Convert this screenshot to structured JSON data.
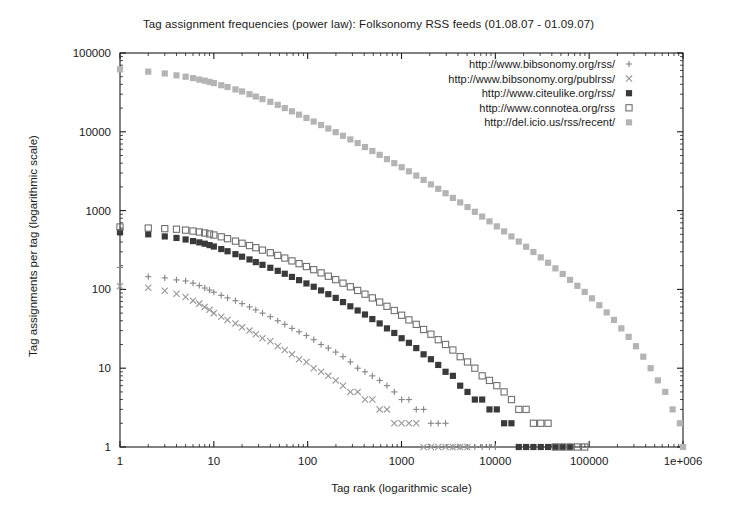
{
  "chart_data": {
    "type": "scatter",
    "title": "Tag assignment frequencies (power law): Folksonomy RSS feeds (01.08.07 - 01.09.07)",
    "xlabel": "Tag rank (logarithmic scale)",
    "ylabel": "Tag assignments per tag (logarithmic scale)",
    "xscale": "log",
    "yscale": "log",
    "xlim": [
      1,
      1000000
    ],
    "ylim": [
      1,
      100000
    ],
    "grid": false,
    "legend_position": "top-right",
    "xticks": [
      {
        "value": 1,
        "label": "1"
      },
      {
        "value": 10,
        "label": "10"
      },
      {
        "value": 100,
        "label": "100"
      },
      {
        "value": 1000,
        "label": "1000"
      },
      {
        "value": 10000,
        "label": "10000"
      },
      {
        "value": 100000,
        "label": "100000"
      },
      {
        "value": 1000000,
        "label": "1e+006"
      }
    ],
    "yticks": [
      {
        "value": 1,
        "label": "1"
      },
      {
        "value": 10,
        "label": "10"
      },
      {
        "value": 100,
        "label": "100"
      },
      {
        "value": 1000,
        "label": "1000"
      },
      {
        "value": 10000,
        "label": "10000"
      },
      {
        "value": 100000,
        "label": "100000"
      }
    ],
    "series": [
      {
        "name": "http://www.bibsonomy.org/rss/",
        "marker": "plus",
        "color": "#888888",
        "points": [
          [
            1,
            190
          ],
          [
            2,
            145
          ],
          [
            3,
            140
          ],
          [
            4,
            132
          ],
          [
            5,
            128
          ],
          [
            6,
            120
          ],
          [
            7,
            112
          ],
          [
            8,
            104
          ],
          [
            9,
            98
          ],
          [
            10,
            92
          ],
          [
            12,
            84
          ],
          [
            14,
            78
          ],
          [
            17,
            72
          ],
          [
            20,
            66
          ],
          [
            24,
            60
          ],
          [
            28,
            55
          ],
          [
            33,
            50
          ],
          [
            40,
            45
          ],
          [
            48,
            40
          ],
          [
            57,
            36
          ],
          [
            68,
            32
          ],
          [
            81,
            29
          ],
          [
            97,
            26
          ],
          [
            116,
            23
          ],
          [
            139,
            20
          ],
          [
            166,
            18
          ],
          [
            199,
            16
          ],
          [
            238,
            14
          ],
          [
            285,
            12
          ],
          [
            341,
            10
          ],
          [
            408,
            9
          ],
          [
            489,
            8
          ],
          [
            585,
            7
          ],
          [
            700,
            6
          ],
          [
            838,
            5
          ],
          [
            1003,
            4
          ],
          [
            1200,
            4
          ],
          [
            1437,
            3
          ],
          [
            1720,
            3
          ],
          [
            2058,
            2
          ],
          [
            2463,
            2
          ],
          [
            2948,
            2
          ],
          [
            3528,
            1
          ],
          [
            4222,
            1
          ],
          [
            5053,
            1
          ],
          [
            6048,
            1
          ],
          [
            7238,
            1
          ],
          [
            8663,
            1
          ],
          [
            10000,
            1
          ]
        ]
      },
      {
        "name": "http://www.bibsonomy.org/publrss/",
        "marker": "cross",
        "color": "#9a9a9a",
        "points": [
          [
            1,
            110
          ],
          [
            2,
            105
          ],
          [
            3,
            96
          ],
          [
            4,
            88
          ],
          [
            5,
            80
          ],
          [
            6,
            72
          ],
          [
            7,
            66
          ],
          [
            8,
            60
          ],
          [
            9,
            55
          ],
          [
            10,
            50
          ],
          [
            12,
            45
          ],
          [
            14,
            41
          ],
          [
            17,
            37
          ],
          [
            20,
            33
          ],
          [
            24,
            30
          ],
          [
            28,
            27
          ],
          [
            33,
            24
          ],
          [
            40,
            22
          ],
          [
            48,
            19
          ],
          [
            57,
            17
          ],
          [
            68,
            15
          ],
          [
            81,
            13
          ],
          [
            97,
            12
          ],
          [
            116,
            10
          ],
          [
            139,
            9
          ],
          [
            166,
            8
          ],
          [
            199,
            7
          ],
          [
            238,
            6
          ],
          [
            285,
            5
          ],
          [
            341,
            5
          ],
          [
            408,
            4
          ],
          [
            489,
            4
          ],
          [
            585,
            3
          ],
          [
            700,
            3
          ],
          [
            838,
            2
          ],
          [
            1003,
            2
          ],
          [
            1200,
            2
          ],
          [
            1437,
            2
          ],
          [
            1720,
            1
          ],
          [
            2058,
            1
          ],
          [
            2463,
            1
          ],
          [
            2948,
            1
          ],
          [
            3528,
            1
          ],
          [
            4222,
            1
          ],
          [
            5053,
            1
          ]
        ]
      },
      {
        "name": "http://www.citeulike.org/rss/",
        "marker": "filled-square",
        "color": "#3a3a3a",
        "points": [
          [
            1,
            530
          ],
          [
            2,
            500
          ],
          [
            3,
            470
          ],
          [
            4,
            450
          ],
          [
            5,
            430
          ],
          [
            6,
            410
          ],
          [
            7,
            395
          ],
          [
            8,
            380
          ],
          [
            9,
            365
          ],
          [
            10,
            350
          ],
          [
            12,
            325
          ],
          [
            14,
            305
          ],
          [
            17,
            280
          ],
          [
            20,
            260
          ],
          [
            24,
            240
          ],
          [
            28,
            222
          ],
          [
            33,
            205
          ],
          [
            40,
            188
          ],
          [
            48,
            172
          ],
          [
            57,
            158
          ],
          [
            68,
            144
          ],
          [
            81,
            131
          ],
          [
            97,
            119
          ],
          [
            116,
            108
          ],
          [
            139,
            97
          ],
          [
            166,
            87
          ],
          [
            199,
            78
          ],
          [
            238,
            69
          ],
          [
            285,
            61
          ],
          [
            341,
            54
          ],
          [
            408,
            48
          ],
          [
            489,
            42
          ],
          [
            585,
            37
          ],
          [
            700,
            32
          ],
          [
            838,
            28
          ],
          [
            1003,
            24
          ],
          [
            1200,
            21
          ],
          [
            1437,
            18
          ],
          [
            1720,
            15
          ],
          [
            2058,
            13
          ],
          [
            2463,
            11
          ],
          [
            2948,
            9
          ],
          [
            3528,
            8
          ],
          [
            4222,
            6
          ],
          [
            5053,
            5
          ],
          [
            6048,
            4
          ],
          [
            7238,
            4
          ],
          [
            8663,
            3
          ],
          [
            10368,
            3
          ],
          [
            12409,
            2
          ],
          [
            14853,
            2
          ],
          [
            17779,
            1
          ],
          [
            21281,
            1
          ],
          [
            25472,
            1
          ],
          [
            30490,
            1
          ],
          [
            36490,
            1
          ],
          [
            43673,
            1
          ],
          [
            52270,
            1
          ],
          [
            62560,
            1
          ]
        ]
      },
      {
        "name": "http://www.connotea.org/rss",
        "marker": "open-square",
        "color": "#707070",
        "points": [
          [
            1,
            620
          ],
          [
            2,
            600
          ],
          [
            3,
            590
          ],
          [
            4,
            580
          ],
          [
            5,
            565
          ],
          [
            6,
            550
          ],
          [
            7,
            535
          ],
          [
            8,
            520
          ],
          [
            9,
            505
          ],
          [
            10,
            490
          ],
          [
            12,
            465
          ],
          [
            14,
            440
          ],
          [
            17,
            410
          ],
          [
            20,
            385
          ],
          [
            24,
            360
          ],
          [
            28,
            338
          ],
          [
            33,
            315
          ],
          [
            40,
            292
          ],
          [
            48,
            270
          ],
          [
            57,
            250
          ],
          [
            68,
            230
          ],
          [
            81,
            212
          ],
          [
            97,
            195
          ],
          [
            116,
            178
          ],
          [
            139,
            162
          ],
          [
            166,
            147
          ],
          [
            199,
            133
          ],
          [
            238,
            120
          ],
          [
            285,
            108
          ],
          [
            341,
            97
          ],
          [
            408,
            87
          ],
          [
            489,
            78
          ],
          [
            585,
            69
          ],
          [
            700,
            61
          ],
          [
            838,
            54
          ],
          [
            1003,
            47
          ],
          [
            1200,
            41
          ],
          [
            1437,
            36
          ],
          [
            1720,
            31
          ],
          [
            2058,
            27
          ],
          [
            2463,
            23
          ],
          [
            2948,
            20
          ],
          [
            3528,
            17
          ],
          [
            4222,
            14
          ],
          [
            5053,
            12
          ],
          [
            6048,
            10
          ],
          [
            7238,
            8
          ],
          [
            8663,
            7
          ],
          [
            10368,
            6
          ],
          [
            12409,
            5
          ],
          [
            14853,
            4
          ],
          [
            17779,
            3
          ],
          [
            21281,
            3
          ],
          [
            25472,
            2
          ],
          [
            30490,
            2
          ],
          [
            36490,
            2
          ],
          [
            43673,
            1
          ],
          [
            52270,
            1
          ],
          [
            62560,
            1
          ],
          [
            74880,
            1
          ],
          [
            89622,
            1
          ]
        ]
      },
      {
        "name": "http://del.icio.us/rss/recent/",
        "marker": "light-square",
        "color": "#b4b4b4",
        "points": [
          [
            1,
            62000
          ],
          [
            2,
            58000
          ],
          [
            3,
            55000
          ],
          [
            4,
            52000
          ],
          [
            5,
            50000
          ],
          [
            6,
            48000
          ],
          [
            7,
            46000
          ],
          [
            8,
            44500
          ],
          [
            9,
            43000
          ],
          [
            10,
            41500
          ],
          [
            12,
            39000
          ],
          [
            14,
            37000
          ],
          [
            17,
            34500
          ],
          [
            20,
            32500
          ],
          [
            24,
            30000
          ],
          [
            28,
            28000
          ],
          [
            33,
            26000
          ],
          [
            40,
            24000
          ],
          [
            48,
            22000
          ],
          [
            57,
            20000
          ],
          [
            68,
            18200
          ],
          [
            81,
            16500
          ],
          [
            97,
            15000
          ],
          [
            116,
            13500
          ],
          [
            139,
            12200
          ],
          [
            166,
            11000
          ],
          [
            199,
            9900
          ],
          [
            238,
            8900
          ],
          [
            285,
            8000
          ],
          [
            341,
            7200
          ],
          [
            408,
            6400
          ],
          [
            489,
            5700
          ],
          [
            585,
            5100
          ],
          [
            700,
            4500
          ],
          [
            838,
            4000
          ],
          [
            1003,
            3550
          ],
          [
            1200,
            3150
          ],
          [
            1437,
            2780
          ],
          [
            1720,
            2450
          ],
          [
            2058,
            2150
          ],
          [
            2463,
            1890
          ],
          [
            2948,
            1660
          ],
          [
            3528,
            1450
          ],
          [
            4222,
            1270
          ],
          [
            5053,
            1110
          ],
          [
            6048,
            965
          ],
          [
            7238,
            840
          ],
          [
            8663,
            730
          ],
          [
            10368,
            630
          ],
          [
            12409,
            545
          ],
          [
            14853,
            470
          ],
          [
            17779,
            405
          ],
          [
            21281,
            348
          ],
          [
            25472,
            298
          ],
          [
            30490,
            255
          ],
          [
            36490,
            218
          ],
          [
            43673,
            185
          ],
          [
            52270,
            157
          ],
          [
            62560,
            132
          ],
          [
            74880,
            111
          ],
          [
            89622,
            93
          ],
          [
            107267,
            77
          ],
          [
            128383,
            63
          ],
          [
            153661,
            51
          ],
          [
            183916,
            41
          ],
          [
            220122,
            32
          ],
          [
            263444,
            25
          ],
          [
            315278,
            19
          ],
          [
            377300,
            14
          ],
          [
            451534,
            10
          ],
          [
            540400,
            7
          ],
          [
            646800,
            5
          ],
          [
            774000,
            3
          ],
          [
            926000,
            2
          ],
          [
            1000000,
            1
          ]
        ]
      }
    ]
  }
}
